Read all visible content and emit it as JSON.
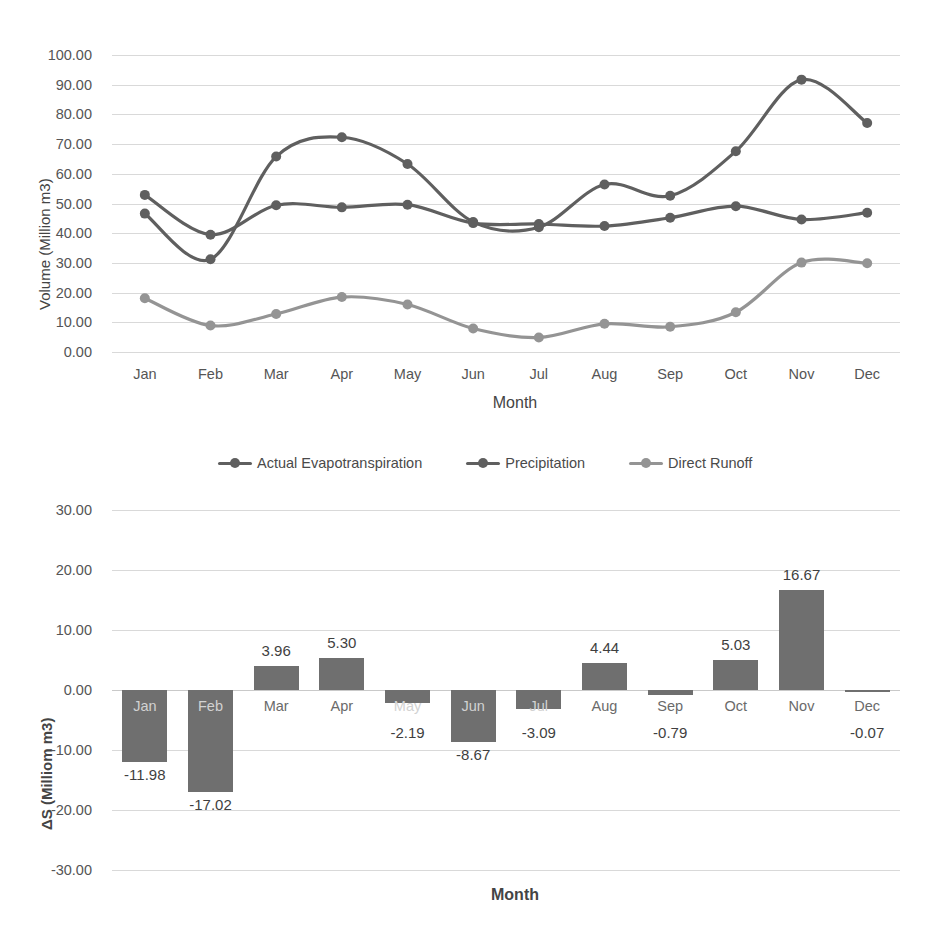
{
  "chart_data": [
    {
      "type": "line",
      "title": "",
      "xlabel": "Month",
      "ylabel": "Volume (Million m3)",
      "categories": [
        "Jan",
        "Feb",
        "Mar",
        "Apr",
        "May",
        "Jun",
        "Jul",
        "Aug",
        "Sep",
        "Oct",
        "Nov",
        "Dec"
      ],
      "ylim": [
        0,
        100
      ],
      "ytick_labels": [
        "0.00",
        "10.00",
        "20.00",
        "30.00",
        "40.00",
        "50.00",
        "60.00",
        "70.00",
        "80.00",
        "90.00",
        "100.00"
      ],
      "ytick_values": [
        0,
        10,
        20,
        30,
        40,
        50,
        60,
        70,
        80,
        90,
        100
      ],
      "grid": true,
      "legend_position": "below-plot",
      "series": [
        {
          "name": "Actual Evapotranspiration",
          "color": "#5f5f5f",
          "values": [
            46.6,
            31.2,
            65.8,
            72.3,
            63.3,
            43.8,
            42.0,
            56.4,
            52.6,
            67.6,
            91.7,
            77.1
          ]
        },
        {
          "name": "Precipitation",
          "color": "#5f5f5f",
          "values": [
            52.9,
            39.5,
            49.4,
            48.7,
            49.6,
            43.4,
            43.1,
            42.4,
            45.2,
            49.1,
            44.6,
            46.9
          ]
        },
        {
          "name": "Direct Runoff",
          "color": "#949494",
          "values": [
            18.1,
            8.9,
            12.8,
            18.5,
            16.0,
            7.9,
            4.9,
            9.5,
            8.5,
            13.4,
            30.1,
            29.9
          ]
        }
      ]
    },
    {
      "type": "bar",
      "title": "",
      "xlabel": "Month",
      "ylabel": "ΔS (Milliom m3)",
      "categories": [
        "Jan",
        "Feb",
        "Mar",
        "Apr",
        "May",
        "Jun",
        "Jul",
        "Aug",
        "Sep",
        "Oct",
        "Nov",
        "Dec"
      ],
      "values": [
        -11.98,
        -17.02,
        3.96,
        5.3,
        -2.19,
        -8.67,
        -3.09,
        4.44,
        -0.79,
        5.03,
        16.67,
        -0.07
      ],
      "value_labels": [
        "-11.98",
        "-17.02",
        "3.96",
        "5.30",
        "-2.19",
        "-8.67",
        "-3.09",
        "4.44",
        "-0.79",
        "5.03",
        "16.67",
        "-0.07"
      ],
      "ylim": [
        -30,
        30
      ],
      "ytick_labels": [
        "-30.00",
        "-20.00",
        "-10.00",
        "0.00",
        "10.00",
        "20.00",
        "30.00"
      ],
      "ytick_values": [
        -30,
        -20,
        -10,
        0,
        10,
        20,
        30
      ],
      "bar_color": "#6f6f6f",
      "grid": true
    }
  ],
  "line_chart": {
    "ylabel": "Volume (Million m3)",
    "xlabel": "Month"
  },
  "bar_chart": {
    "ylabel": "ΔS (Milliom m3)",
    "xlabel": "Month"
  },
  "legend": {
    "items": [
      {
        "label": "Actual Evapotranspiration",
        "color": "#5f5f5f"
      },
      {
        "label": "Precipitation",
        "color": "#5f5f5f"
      },
      {
        "label": "Direct Runoff",
        "color": "#949494"
      }
    ]
  }
}
